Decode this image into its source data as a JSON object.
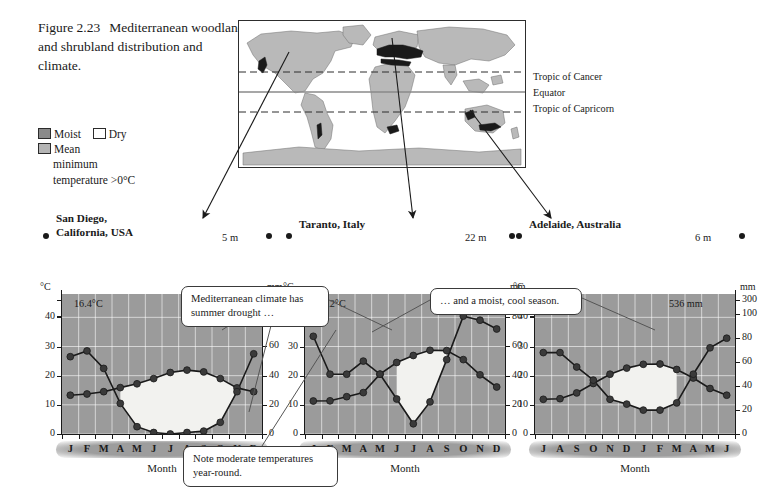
{
  "caption": {
    "figure_number": "Figure 2.23",
    "text": "Mediterranean woodland and shrubland distribution and climate."
  },
  "legend": {
    "items": [
      {
        "label": "Moist",
        "swatch": "dark-gray",
        "color": "#8a8a8a"
      },
      {
        "label": "Dry",
        "swatch": "white",
        "color": "#ffffff"
      },
      {
        "label": "Mean",
        "label_line2": "minimum",
        "label_line3": "temperature >0°C",
        "swatch": "mid-gray",
        "color": "#b4b4b4"
      }
    ]
  },
  "map": {
    "labels": {
      "tropic_of_cancer": "Tropic of Cancer",
      "equator": "Equator",
      "tropic_of_capricorn": "Tropic of Capricorn"
    },
    "land_color": "#b9b9b9",
    "highlight_color": "#1a1a1a"
  },
  "callouts": {
    "drought": "Mediterranean climate has summer drought …",
    "moist": "… and a moist, cool season.",
    "note": "Note moderate temperatures year-round."
  },
  "chart_data": [
    {
      "type": "line",
      "title": "San Diego,",
      "title_line2": "California, USA",
      "elevation": "5 m",
      "mean_temp": "16.4°C",
      "total_precip": "259 mm",
      "xlabel": "Month",
      "left_unit": "°C",
      "right_unit": "mm",
      "categories": [
        "J",
        "F",
        "M",
        "A",
        "M",
        "J",
        "J",
        "A",
        "S",
        "O",
        "N",
        "D"
      ],
      "temp_ticks": [
        0,
        10,
        20,
        30,
        40
      ],
      "precip_ticks": [
        0,
        20,
        40,
        60,
        80,
        300
      ],
      "series": [
        {
          "name": "Temperature",
          "unit": "°C",
          "values": [
            13.3,
            13.7,
            14.5,
            15.9,
            17.2,
            19.0,
            21.1,
            21.9,
            21.3,
            19.0,
            15.8,
            14.5
          ]
        },
        {
          "name": "Precipitation",
          "unit": "mm",
          "values": [
            53,
            57,
            45,
            21,
            5,
            1,
            0,
            1,
            2,
            8,
            29,
            55
          ]
        }
      ]
    },
    {
      "type": "line",
      "title": "Taranto, Italy",
      "title_line2": "",
      "elevation": "22 m",
      "mean_temp": "17.2°C",
      "total_precip": "538 mm",
      "xlabel": "Month",
      "left_unit": "°C",
      "right_unit": "mm",
      "categories": [
        "J",
        "F",
        "M",
        "A",
        "M",
        "J",
        "J",
        "A",
        "S",
        "O",
        "N",
        "D"
      ],
      "temp_ticks": [
        0,
        10,
        20,
        30,
        40
      ],
      "precip_ticks": [
        0,
        20,
        40,
        60,
        80,
        300
      ],
      "series": [
        {
          "name": "Temperature",
          "unit": "°C",
          "values": [
            11.3,
            11.4,
            12.8,
            14.2,
            20.5,
            24.5,
            26.9,
            28.7,
            28.6,
            25.5,
            20.3,
            16.1,
            12.6
          ]
        },
        {
          "name": "Precipitation",
          "unit": "mm",
          "values": [
            67,
            41,
            41,
            50,
            41,
            24,
            7,
            22,
            51,
            95,
            78,
            72
          ]
        }
      ]
    },
    {
      "type": "line",
      "title": "Adelaide, Australia",
      "title_line2": "",
      "elevation": "6 m",
      "mean_temp": "17.2°C",
      "total_precip": "536 mm",
      "xlabel": "Month",
      "left_unit": "°C",
      "right_unit": "mm",
      "categories": [
        "J",
        "A",
        "S",
        "O",
        "N",
        "D",
        "J",
        "F",
        "M",
        "A",
        "M",
        "J"
      ],
      "temp_ticks": [
        0,
        10,
        20,
        30,
        40
      ],
      "precip_ticks": [
        0,
        20,
        40,
        60,
        80,
        100,
        300
      ],
      "series": [
        {
          "name": "Temperature",
          "unit": "°C",
          "values": [
            11.9,
            12.1,
            14.1,
            17.3,
            20.5,
            22.6,
            23.9,
            24.0,
            22.1,
            19.2,
            15.6,
            13.3
          ]
        },
        {
          "name": "Precipitation",
          "unit": "mm",
          "values": [
            68,
            68,
            56,
            45,
            29,
            25,
            20,
            20,
            26,
            50,
            72,
            80
          ]
        }
      ]
    }
  ]
}
